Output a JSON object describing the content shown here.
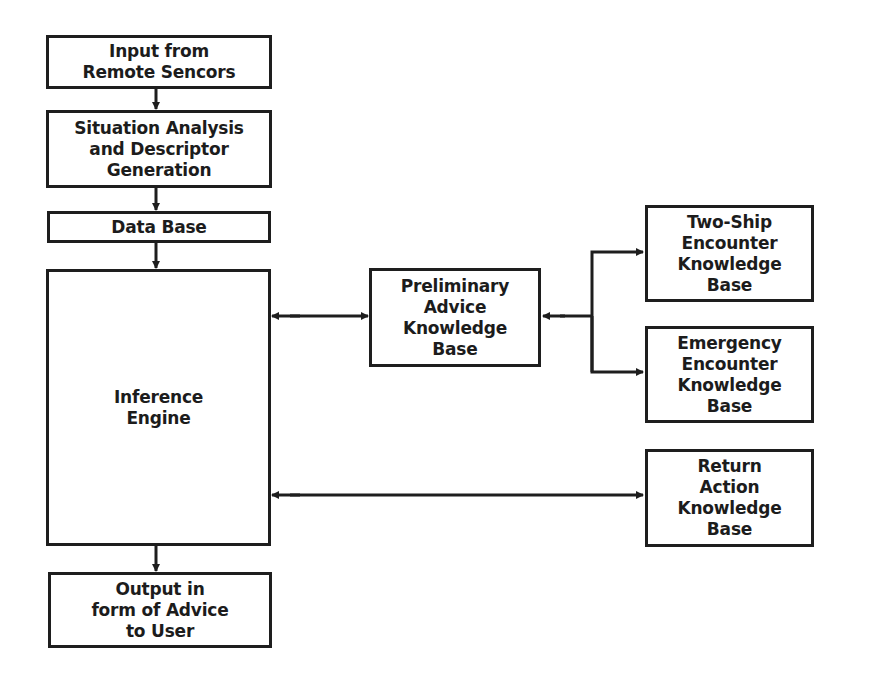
{
  "diagram": {
    "nodes": {
      "input": {
        "label": "Input from\nRemote Sencors"
      },
      "situation": {
        "label": "Situation Analysis\nand Descriptor\nGeneration"
      },
      "database": {
        "label": "Data Base"
      },
      "inference": {
        "label": "Inference\nEngine"
      },
      "output": {
        "label": "Output in\nform of Advice\nto User"
      },
      "preliminary": {
        "label": "Preliminary\nAdvice\nKnowledge\nBase"
      },
      "twoship": {
        "label": "Two-Ship\nEncounter\nKnowledge\nBase"
      },
      "emergency": {
        "label": "Emergency\nEncounter\nKnowledge\nBase"
      },
      "return": {
        "label": "Return\nAction\nKnowledge\nBase"
      }
    },
    "edges": [
      {
        "from": "input",
        "to": "situation",
        "type": "arrow"
      },
      {
        "from": "situation",
        "to": "database",
        "type": "arrow"
      },
      {
        "from": "database",
        "to": "inference",
        "type": "arrow"
      },
      {
        "from": "inference",
        "to": "output",
        "type": "arrow"
      },
      {
        "from": "inference",
        "to": "preliminary",
        "type": "bidirectional"
      },
      {
        "from": "preliminary",
        "to": "twoship",
        "type": "bidirectional-branch"
      },
      {
        "from": "preliminary",
        "to": "emergency",
        "type": "bidirectional-branch"
      },
      {
        "from": "inference",
        "to": "return",
        "type": "bidirectional"
      }
    ],
    "colors": {
      "stroke": "#1e1e1e",
      "background": "#ffffff",
      "text": "#1c1c1c"
    }
  }
}
